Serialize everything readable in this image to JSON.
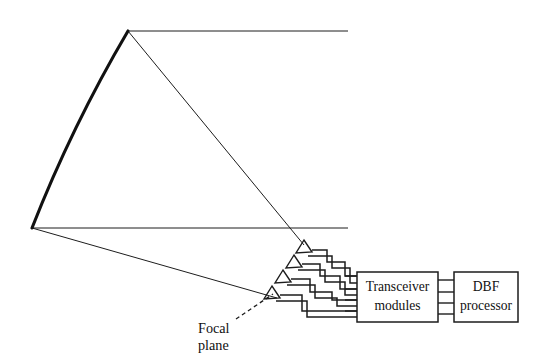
{
  "figure": {
    "type": "diagram",
    "background_color": "#ffffff",
    "line_color": "#1d1d1d",
    "width": 543,
    "height": 363
  },
  "labels": {
    "focal_plane": {
      "line1": "Focal",
      "line2": "plane",
      "x": 198,
      "y": 330
    }
  },
  "boxes": [
    {
      "id": "transceiver-modules",
      "line1": "Transceiver",
      "line2": "modules",
      "x": 357,
      "y": 272,
      "width": 81,
      "height": 50
    },
    {
      "id": "dbf-processor",
      "line1": "DBF",
      "line2": "processor",
      "x": 454,
      "y": 272,
      "width": 64,
      "height": 50
    }
  ],
  "geometry": {
    "reflector": {
      "top_vertex": [
        128,
        31
      ],
      "bottom_vertex": [
        32,
        228
      ],
      "curve_control": [
        72,
        128
      ],
      "stroke_width": 3.1
    },
    "incident_rays": [
      {
        "from": [
          128,
          31
        ],
        "to": [
          348,
          31
        ]
      },
      {
        "from": [
          32,
          228
        ],
        "to": [
          348,
          228
        ]
      }
    ],
    "reflected_rays": [
      {
        "from": [
          128,
          31
        ],
        "to": [
          303,
          244
        ]
      },
      {
        "from": [
          32,
          228
        ],
        "to": [
          276,
          297
        ]
      }
    ],
    "horn_count": 4,
    "horns": [
      {
        "apex": [
          303,
          241
        ],
        "base_top": [
          297,
          253
        ],
        "base_bottom": [
          311,
          252
        ]
      },
      {
        "apex": [
          293,
          255
        ],
        "base_top": [
          287,
          267
        ],
        "base_bottom": [
          301,
          266
        ]
      },
      {
        "apex": [
          283,
          270
        ],
        "base_top": [
          277,
          282
        ],
        "base_bottom": [
          291,
          281
        ]
      },
      {
        "apex": [
          272,
          286
        ],
        "base_top": [
          266,
          298
        ],
        "base_bottom": [
          280,
          297
        ]
      }
    ],
    "bus_lines_left": [
      280,
      292,
      303,
      314
    ],
    "bus_lines_right": [
      280,
      292,
      303,
      314
    ],
    "leader_line": {
      "from": [
        237,
        319
      ],
      "to": [
        273,
        295
      ]
    }
  }
}
